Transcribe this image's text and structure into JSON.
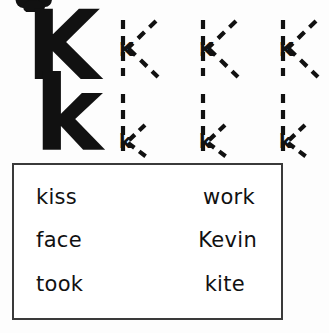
{
  "worksheet": {
    "letter": "K",
    "clipart_name": "paw-print-clipart",
    "ink_color": "#111111",
    "box_border_color": "#3a3a3a",
    "background_color": "#fdfdfd"
  },
  "rows": [
    {
      "name": "uppercase-row",
      "model_letter": "K",
      "case": "uppercase",
      "trace_count": 3,
      "trace_letter": "K"
    },
    {
      "name": "lowercase-row",
      "model_letter": "k",
      "case": "lowercase",
      "trace_count": 3,
      "trace_letter": "k"
    }
  ],
  "word_box": {
    "rows": [
      {
        "left": "kiss",
        "right": "work"
      },
      {
        "left": "face",
        "right": "Kevin"
      },
      {
        "left": "took",
        "right": "kite"
      }
    ]
  }
}
